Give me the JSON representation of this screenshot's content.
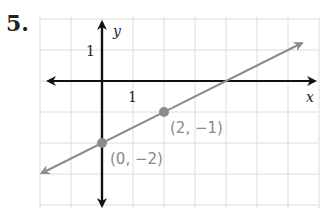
{
  "problem": {
    "number": "5."
  },
  "chart_data": {
    "type": "line",
    "title": "",
    "xlabel": "x",
    "ylabel": "y",
    "x_tick_label": "1",
    "y_tick_label": "1",
    "xlim": [
      -2,
      7
    ],
    "ylim": [
      -4,
      2
    ],
    "grid": true,
    "line": {
      "slope": 0.5,
      "intercept": -2,
      "equation": "y = 0.5x - 2",
      "color": "#8c8c8c"
    },
    "points": [
      {
        "x": 0,
        "y": -2,
        "label": "(0, −2)"
      },
      {
        "x": 2,
        "y": -1,
        "label": "(2, −1)"
      }
    ],
    "colors": {
      "axes": "#111111",
      "grid": "#dcdcdc",
      "line": "#8c8c8c",
      "point": "#8c8c8c"
    }
  }
}
